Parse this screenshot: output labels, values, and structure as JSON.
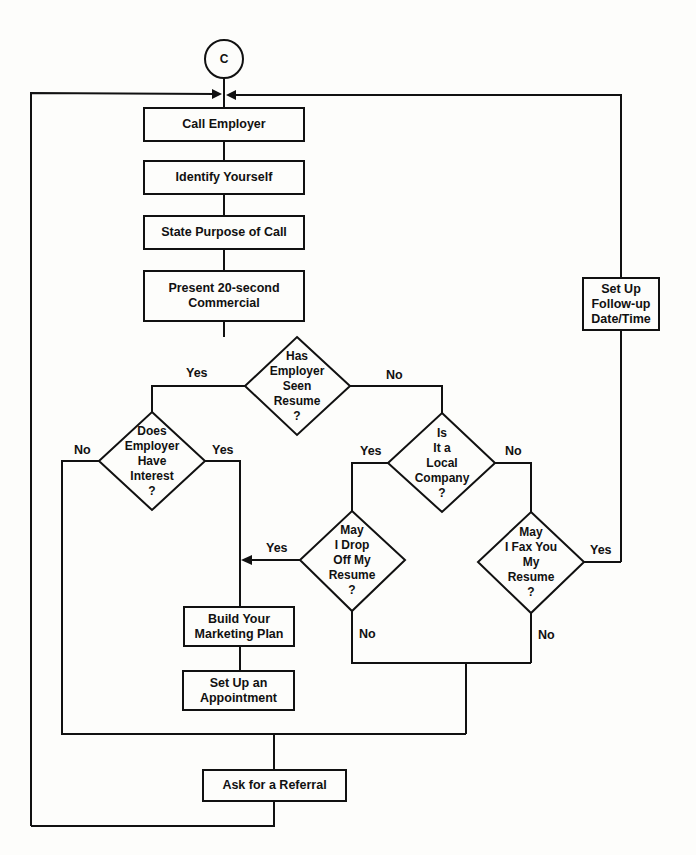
{
  "diagram": {
    "type": "flowchart",
    "connector": {
      "label": "C"
    },
    "process_boxes": {
      "call_employer": "Call Employer",
      "identify_yourself": "Identify Yourself",
      "state_purpose": "State Purpose of Call",
      "present_commercial": "Present 20-second\nCommercial",
      "set_up_follow_up": "Set Up\nFollow-up\nDate/Time",
      "build_marketing_plan": "Build Your\nMarketing Plan",
      "set_up_appointment": "Set Up an\nAppointment",
      "ask_referral": "Ask for a Referral"
    },
    "decisions": {
      "seen_resume": "Has\nEmployer\nSeen\nResume\n?",
      "employer_interest": "Does\nEmployer\nHave\nInterest\n?",
      "local_company": "Is\nIt a\nLocal\nCompany\n?",
      "drop_off_resume": "May\nI Drop\nOff My\nResume\n?",
      "fax_resume": "May\nI Fax You\nMy\nResume\n?"
    },
    "branch_labels": {
      "seen_yes": "Yes",
      "seen_no": "No",
      "interest_no": "No",
      "interest_yes": "Yes",
      "local_yes": "Yes",
      "local_no": "No",
      "drop_yes": "Yes",
      "drop_no": "No",
      "fax_yes": "Yes",
      "fax_no": "No"
    }
  }
}
